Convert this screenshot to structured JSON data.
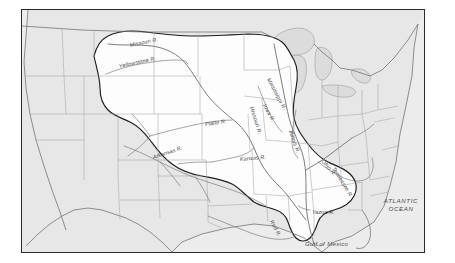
{
  "map": {
    "title": "Mississippi River Drainage Basin",
    "frame": {
      "x": 21,
      "y": 9,
      "width": 404,
      "height": 244
    },
    "colors": {
      "frame_border": "#2b2b2b",
      "page_background": "#ffffff",
      "basin_fill": "#fdfdfd",
      "outside_land_fill": "#e3e3e3",
      "ocean_fill": "#ececec",
      "lake_fill": "#dcdcdc",
      "state_line": "#9a9a9a",
      "basin_line": "#1d1d1d",
      "river_line": "#6f6f6f",
      "coast_line": "#7a7a7a",
      "label_text": "#444444"
    },
    "river_labels": [
      {
        "id": "missouri-upper",
        "text": "Missouri R.",
        "x": 108,
        "y": 33,
        "rotate": -12
      },
      {
        "id": "yellowstone",
        "text": "Yellowstone R.",
        "x": 97,
        "y": 54,
        "rotate": -12
      },
      {
        "id": "platte",
        "text": "Platte R.",
        "x": 183,
        "y": 112,
        "rotate": -8
      },
      {
        "id": "missouri-mid",
        "text": "Missouri R.",
        "x": 229,
        "y": 94,
        "rotate": 72
      },
      {
        "id": "mississippi-upper",
        "text": "Mississippi R.",
        "x": 246,
        "y": 66,
        "rotate": 62
      },
      {
        "id": "iowa",
        "text": "Iowa R.",
        "x": 242,
        "y": 92,
        "rotate": 62
      },
      {
        "id": "arkansas",
        "text": "Arkansas R.",
        "x": 131,
        "y": 145,
        "rotate": -18
      },
      {
        "id": "kansas",
        "text": "Kansas R.",
        "x": 218,
        "y": 147,
        "rotate": -5
      },
      {
        "id": "illinois",
        "text": "Illinois R.",
        "x": 268,
        "y": 118,
        "rotate": 70
      },
      {
        "id": "ohio",
        "text": "Ohio R.",
        "x": 300,
        "y": 148,
        "rotate": 48
      },
      {
        "id": "tennessee",
        "text": "Tennessee R.",
        "x": 311,
        "y": 155,
        "rotate": 58
      },
      {
        "id": "red",
        "text": "Red R.",
        "x": 249,
        "y": 208,
        "rotate": 62
      },
      {
        "id": "yazoo",
        "text": "Yazoo R.",
        "x": 290,
        "y": 200,
        "rotate": 0
      }
    ],
    "water_body_labels": [
      {
        "id": "atlantic-ocean",
        "line1": "ATLANTIC",
        "line2": "OCEAN",
        "x": 377,
        "y": 194
      },
      {
        "id": "gulf-of-mexico",
        "text": "Gulf of Mexico",
        "x": 304,
        "y": 237
      }
    ]
  }
}
